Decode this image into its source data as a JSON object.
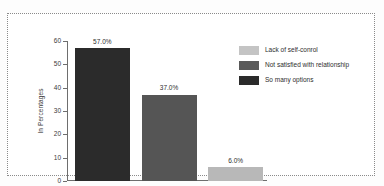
{
  "chart_data": {
    "type": "bar",
    "title": "",
    "xlabel": "",
    "ylabel": "In Percentages",
    "ylim": [
      0,
      60
    ],
    "yticks": [
      0,
      10,
      20,
      30,
      40,
      50,
      60
    ],
    "ytick_labels": [
      "0",
      "10",
      "20",
      "30",
      "40",
      "50",
      "60"
    ],
    "grid": false,
    "legend_position": "top-right",
    "categories": [
      "So many options",
      "Not satisfied with relationship",
      "Lack of self-conrol"
    ],
    "values": [
      57.0,
      37.0,
      6.0
    ],
    "data_labels": [
      "57.0%",
      "37.0%",
      "6.0%"
    ],
    "bar_colors": [
      "#2b2b2b",
      "#555555",
      "#b8b8b8"
    ],
    "bars": [
      {
        "label": "So many options",
        "value": 57.0,
        "data_label": "57.0%",
        "color": "#2b2b2b"
      },
      {
        "label": "Not satisfied with relationship",
        "value": 37.0,
        "data_label": "37.0%",
        "color": "#555555"
      },
      {
        "label": "Lack of self-conrol",
        "value": 6.0,
        "data_label": "6.0%",
        "color": "#b8b8b8"
      }
    ],
    "legend": [
      {
        "label": "Lack of self-conrol",
        "color": "#c4c4c4"
      },
      {
        "label": "Not satisfied with relationship",
        "color": "#5a5a5a"
      },
      {
        "label": "So many options",
        "color": "#2b2b2b"
      }
    ]
  }
}
